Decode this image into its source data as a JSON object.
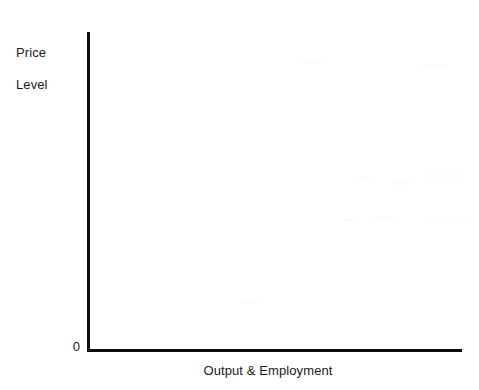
{
  "figure": {
    "canvas_width": 479,
    "canvas_height": 390,
    "background_color": "#ffffff",
    "axis_color": "#0d0d0d",
    "text_color": "#1a1a1a"
  },
  "labels": {
    "y_axis_line1": "Price",
    "y_axis_line2": "Level",
    "origin": "0",
    "x_axis": "Output & Employment"
  },
  "chart_data": {
    "type": "line",
    "title": "",
    "subtitle": "",
    "xlabel": "Output & Employment",
    "ylabel": "Price Level",
    "origin_label": "0",
    "series": [],
    "x": [],
    "categories": [],
    "values": [],
    "xlim": [
      0,
      1
    ],
    "ylim": [
      0,
      1
    ],
    "xticks": [],
    "yticks": [],
    "xticklabels": [],
    "yticklabels": [],
    "grid": false,
    "legend": false,
    "legend_position": "none",
    "annotations": []
  }
}
